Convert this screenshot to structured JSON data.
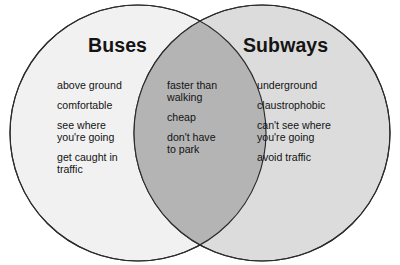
{
  "diagram": {
    "type": "venn-diagram",
    "kind": "two-set-comparison",
    "left_set": {
      "title": "Buses",
      "fill_color": "#f1f1f1",
      "items": [
        "above ground",
        "comfortable",
        "see where\nyou're going",
        "get caught in\ntraffic"
      ]
    },
    "right_set": {
      "title": "Subways",
      "fill_color": "#dcdcdc",
      "items": [
        "underground",
        "claustrophobic",
        "can't see where\nyou're going",
        "avoid traffic"
      ]
    },
    "intersection": {
      "fill_color": "#b4b4b4",
      "items": [
        "faster than\nwalking",
        "cheap",
        "don't have\nto park"
      ]
    },
    "outline_color": "#2b2b2b",
    "background_color": "#ffffff"
  }
}
